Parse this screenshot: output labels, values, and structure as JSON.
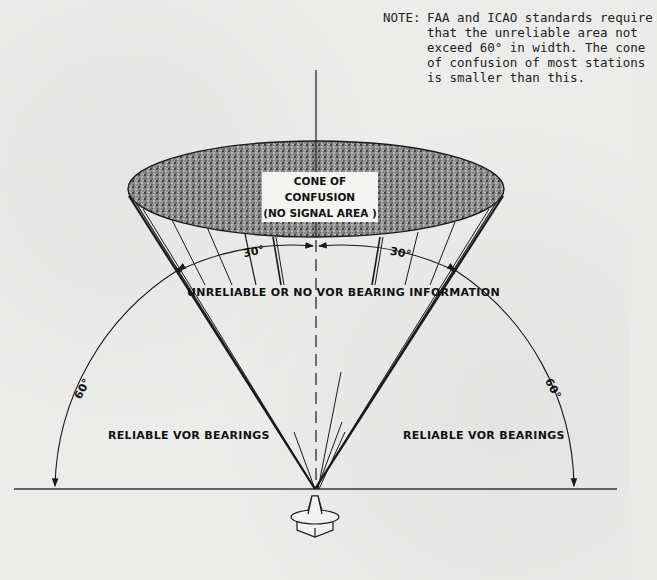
{
  "note": {
    "label": "NOTE:",
    "text": "FAA and ICAO standards require that the unreliable area not exceed 60° in width.  The cone of confusion of most stations is smaller than this."
  },
  "cone": {
    "title": "CONE OF CONFUSION",
    "subtitle": "(NO SIGNAL AREA )"
  },
  "labels": {
    "unreliable": "UNRELIABLE OR NO VOR BEARING INFORMATION",
    "reliable_left": "RELIABLE VOR BEARINGS",
    "reliable_right": "RELIABLE VOR BEARINGS",
    "angle_30_left": "30°",
    "angle_30_right": "30°",
    "angle_60_left": "60°",
    "angle_60_right": "60°"
  },
  "colors": {
    "ink": "#1a1a1a",
    "paper": "#ececeb"
  }
}
